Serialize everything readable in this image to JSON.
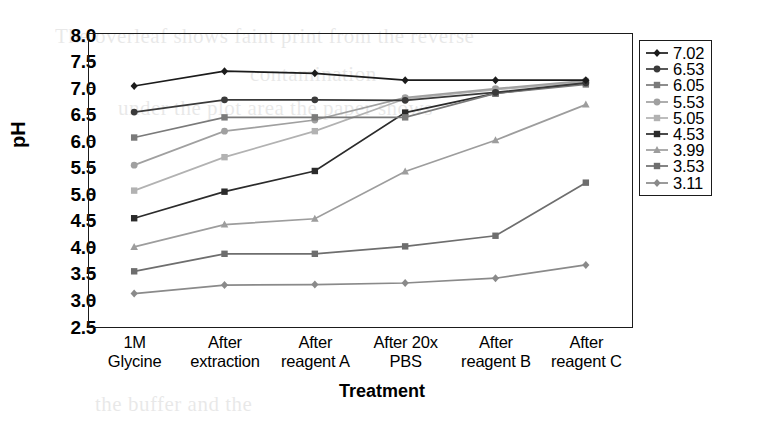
{
  "chart_data": {
    "type": "line",
    "title": "",
    "xlabel": "Treatment",
    "ylabel": "pH",
    "categories": [
      "1M Glycine",
      "After extraction",
      "After reagent A",
      "After 20x PBS",
      "After reagent B",
      "After reagent C"
    ],
    "category_lines": [
      [
        "1M",
        "Glycine"
      ],
      [
        "After",
        "extraction"
      ],
      [
        "After",
        "reagent A"
      ],
      [
        "After 20x",
        "PBS"
      ],
      [
        "After",
        "reagent B"
      ],
      [
        "After",
        "reagent C"
      ]
    ],
    "ylim": [
      2.5,
      8.0
    ],
    "yticks": [
      "2.5",
      "3.0",
      "3.5",
      "4.0",
      "4.5",
      "5.0",
      "5.5",
      "6.0",
      "6.5",
      "7.0",
      "7.5",
      "8.0"
    ],
    "ytick_values": [
      2.5,
      3.0,
      3.5,
      4.0,
      4.5,
      5.0,
      5.5,
      6.0,
      6.5,
      7.0,
      7.5,
      8.0
    ],
    "grid": false,
    "legend_position": "right-inside-top",
    "series": [
      {
        "name": "3.11",
        "color": "#8a8a8a",
        "marker": "diamond",
        "values": [
          3.11,
          3.27,
          3.28,
          3.31,
          3.4,
          3.65
        ]
      },
      {
        "name": "3.53",
        "color": "#6e6e6e",
        "marker": "square",
        "values": [
          3.53,
          3.86,
          3.86,
          4.0,
          4.2,
          5.2
        ]
      },
      {
        "name": "3.99",
        "color": "#9d9d9d",
        "marker": "triangle",
        "values": [
          3.99,
          4.41,
          4.52,
          5.41,
          6.0,
          6.67
        ]
      },
      {
        "name": "4.53",
        "color": "#2b2b2b",
        "marker": "square",
        "values": [
          4.53,
          5.03,
          5.42,
          6.52,
          6.88,
          7.08
        ]
      },
      {
        "name": "5.05",
        "color": "#b2b2b2",
        "marker": "square",
        "values": [
          5.05,
          5.68,
          6.17,
          6.78,
          6.95,
          7.1
        ]
      },
      {
        "name": "5.53",
        "color": "#a0a0a0",
        "marker": "circle",
        "values": [
          5.53,
          6.17,
          6.38,
          6.8,
          6.97,
          7.12
        ]
      },
      {
        "name": "6.05",
        "color": "#7a7a7a",
        "marker": "square",
        "values": [
          6.05,
          6.43,
          6.43,
          6.43,
          6.88,
          7.05
        ]
      },
      {
        "name": "6.53",
        "color": "#3a3a3a",
        "marker": "circle",
        "values": [
          6.53,
          6.76,
          6.76,
          6.75,
          6.9,
          7.08
        ]
      },
      {
        "name": "7.02",
        "color": "#1b1b1b",
        "marker": "diamond",
        "values": [
          7.02,
          7.3,
          7.26,
          7.13,
          7.13,
          7.13
        ]
      }
    ]
  },
  "bleed_text": [
    {
      "t": "The overleaf shows faint print from the reverse",
      "x": 55,
      "y": 24
    },
    {
      "t": "contamination",
      "x": 250,
      "y": 62
    },
    {
      "t": "under the plot area the paper shows",
      "x": 118,
      "y": 96
    },
    {
      "t": "the buffer and the",
      "x": 95,
      "y": 392
    }
  ]
}
